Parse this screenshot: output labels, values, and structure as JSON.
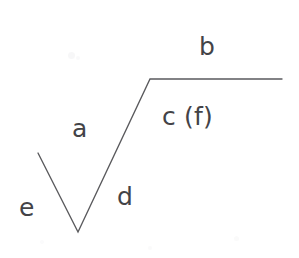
{
  "figure": {
    "background_color": "#ffffff",
    "stroke_color": "#5a5a5d",
    "text_color": "#434347",
    "width": 299,
    "height": 258,
    "labels": [
      {
        "id": "b",
        "text": "b",
        "x": 199,
        "y": 34,
        "describes": "upper-horizontal-segment"
      },
      {
        "id": "c",
        "text": "c (f)",
        "x": 162,
        "y": 104,
        "describes": "below-horizontal-segment"
      },
      {
        "id": "a",
        "text": "a",
        "x": 72,
        "y": 116,
        "describes": "left-of-rising-segment"
      },
      {
        "id": "d",
        "text": "d",
        "x": 117,
        "y": 184,
        "describes": "right-of-rising-segment"
      },
      {
        "id": "e",
        "text": "e",
        "x": 19,
        "y": 195,
        "describes": "left-of-descending-segment"
      }
    ],
    "polyline": {
      "points": "38,153 78,232 150,79 282,79",
      "vertices": [
        {
          "name": "start-upper-left",
          "x": 38,
          "y": 153
        },
        {
          "name": "valley-vertex",
          "x": 78,
          "y": 232
        },
        {
          "name": "plateau-corner",
          "x": 150,
          "y": 79
        },
        {
          "name": "end-right",
          "x": 282,
          "y": 79
        }
      ]
    },
    "specks": [
      {
        "x": 68,
        "y": 52,
        "size": 7,
        "opacity": 0.55
      },
      {
        "x": 76,
        "y": 56,
        "size": 4,
        "opacity": 0.4
      },
      {
        "x": 234,
        "y": 236,
        "size": 5,
        "opacity": 0.35
      },
      {
        "x": 148,
        "y": 246,
        "size": 4,
        "opacity": 0.3
      },
      {
        "x": 40,
        "y": 240,
        "size": 4,
        "opacity": 0.25
      }
    ]
  }
}
